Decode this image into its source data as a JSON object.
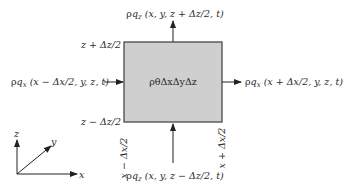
{
  "diagram": {
    "type": "control-volume-flux",
    "colors": {
      "box_fill": "#cfcfcf",
      "box_stroke": "#4a4a4a",
      "line": "#222222",
      "text": "#2a2a2a"
    },
    "box": {
      "label": "ρθΔxΔyΔz"
    },
    "fluxes": {
      "top": {
        "rho": "ρ",
        "q": "q",
        "sub": "z",
        "args": " (x, y, z + Δz/2, t)"
      },
      "bottom": {
        "rho": "ρ",
        "q": "q",
        "sub": "z",
        "args": " (x, y, z − Δz/2, t)"
      },
      "left": {
        "rho": "ρ",
        "q": "q",
        "sub": "x",
        "args": " (x − Δx/2, y, z, t)"
      },
      "right": {
        "rho": "ρ",
        "q": "q",
        "sub": "x",
        "args": " (x + Δx/2, y, z, t)"
      }
    },
    "edge_labels": {
      "top": "z + Δz/2",
      "bottom": "z − Δz/2",
      "left": "x − Δx/2",
      "right": "x + Δx/2"
    },
    "axes": {
      "x": "x",
      "y": "y",
      "z": "z"
    }
  }
}
